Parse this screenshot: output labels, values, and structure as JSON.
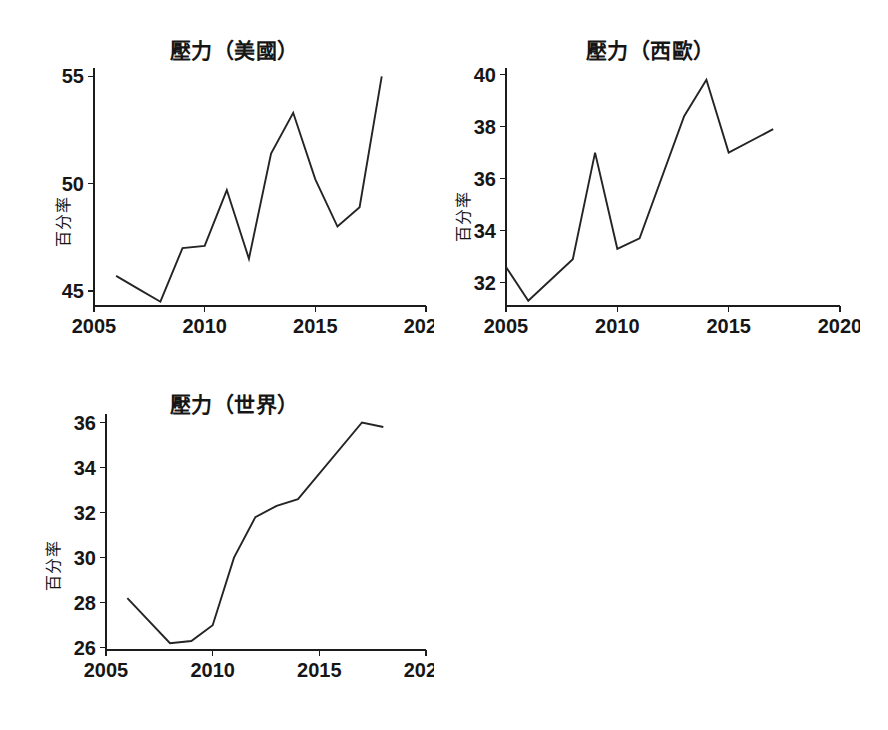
{
  "figure": {
    "background": "#ffffff",
    "line_color": "#242424",
    "axis_color": "#1c1c1c",
    "text_color": "#161616"
  },
  "chart_data": [
    {
      "type": "line",
      "title": "壓力（美國）",
      "xlabel": "",
      "ylabel": "百分率",
      "x": [
        2006,
        2007,
        2008,
        2009,
        2010,
        2011,
        2012,
        2013,
        2014,
        2015,
        2016,
        2017,
        2018
      ],
      "values": [
        45.7,
        45.1,
        44.5,
        47.0,
        47.1,
        49.7,
        46.5,
        51.4,
        53.3,
        50.2,
        48.0,
        48.9,
        55.0
      ],
      "series": [
        {
          "name": "壓力（美國）",
          "values": [
            45.7,
            45.1,
            44.5,
            47.0,
            47.1,
            49.7,
            46.5,
            51.4,
            53.3,
            50.2,
            48.0,
            48.9,
            55.0
          ]
        }
      ],
      "xlim": [
        2005,
        2020
      ],
      "ylim": [
        44.3,
        55.2
      ],
      "xticks": [
        2005,
        2010,
        2015,
        2020
      ],
      "xtick_labels": [
        "2005",
        "2010",
        "2015",
        "2020"
      ],
      "yticks": [
        45,
        50,
        55
      ],
      "ytick_labels": [
        "45",
        "50",
        "55"
      ],
      "grid": false,
      "legend": false
    },
    {
      "type": "line",
      "title": "壓力（西歐）",
      "xlabel": "",
      "ylabel": "百分率",
      "x": [
        2005,
        2006,
        2008,
        2009,
        2010,
        2011,
        2013,
        2014,
        2015,
        2017
      ],
      "values": [
        32.6,
        31.3,
        32.9,
        37.0,
        33.3,
        33.7,
        38.4,
        39.8,
        37.0,
        37.9
      ],
      "series": [
        {
          "name": "壓力（西歐）",
          "values": [
            32.6,
            31.3,
            32.9,
            37.0,
            33.3,
            33.7,
            38.4,
            39.8,
            37.0,
            37.9
          ]
        }
      ],
      "xlim": [
        2005,
        2020
      ],
      "ylim": [
        31.1,
        40.1
      ],
      "xticks": [
        2005,
        2010,
        2015,
        2020
      ],
      "xtick_labels": [
        "2005",
        "2010",
        "2015",
        "2020"
      ],
      "yticks": [
        32,
        34,
        36,
        38,
        40
      ],
      "ytick_labels": [
        "32",
        "34",
        "36",
        "38",
        "40"
      ],
      "grid": false,
      "legend": false
    },
    {
      "type": "line",
      "title": "壓力（世界）",
      "xlabel": "",
      "ylabel": "百分率",
      "x": [
        2006,
        2008,
        2009,
        2010,
        2011,
        2012,
        2013,
        2014,
        2017,
        2018
      ],
      "values": [
        28.2,
        26.2,
        26.3,
        27.0,
        30.0,
        31.8,
        32.3,
        32.6,
        36.0,
        35.8
      ],
      "series": [
        {
          "name": "壓力（世界）",
          "values": [
            28.2,
            26.2,
            26.3,
            27.0,
            30.0,
            31.8,
            32.3,
            32.6,
            36.0,
            35.8
          ]
        }
      ],
      "xlim": [
        2005,
        2020
      ],
      "ylim": [
        25.9,
        36.2
      ],
      "xticks": [
        2005,
        2010,
        2015,
        2020
      ],
      "xtick_labels": [
        "2005",
        "2010",
        "2015",
        "2020"
      ],
      "yticks": [
        26,
        28,
        30,
        32,
        34,
        36
      ],
      "ytick_labels": [
        "26",
        "28",
        "30",
        "32",
        "34",
        "36"
      ],
      "grid": false,
      "legend": false
    }
  ],
  "panels": [
    {
      "id": "us",
      "title": "壓力（美國）",
      "ylabel": "百分率"
    },
    {
      "id": "western-europe",
      "title": "壓力（西歐）",
      "ylabel": "百分率"
    },
    {
      "id": "world",
      "title": "壓力（世界）",
      "ylabel": "百分率"
    }
  ]
}
